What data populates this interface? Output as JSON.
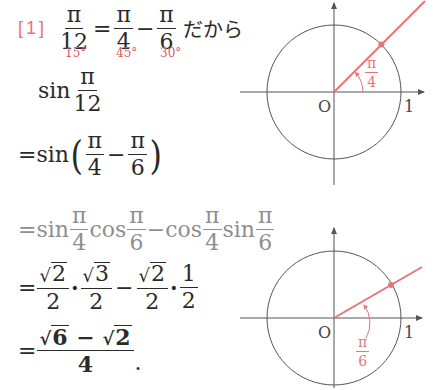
{
  "problem": {
    "label": "[1]",
    "intro": {
      "lhs": {
        "num": "π",
        "den": "12"
      },
      "eq": "=",
      "term1": {
        "num": "π",
        "den": "4"
      },
      "minus": "−",
      "term2": {
        "num": "π",
        "den": "6"
      },
      "suffix": "だから",
      "degrees": [
        "15°",
        "45°",
        "30°"
      ]
    },
    "lines": {
      "line1": {
        "func": "sin",
        "num": "π",
        "den": "12"
      },
      "line2": {
        "prefix": "=sin",
        "open": "(",
        "t1": {
          "num": "π",
          "den": "4"
        },
        "minus": "−",
        "t2": {
          "num": "π",
          "den": "6"
        },
        "close": ")"
      },
      "line3": {
        "prefix": "=sin",
        "a": {
          "num": "π",
          "den": "4"
        },
        "cos1": "cos",
        "b": {
          "num": "π",
          "den": "6"
        },
        "minus": "−cos",
        "c": {
          "num": "π",
          "den": "4"
        },
        "sin2": "sin",
        "d": {
          "num": "π",
          "den": "6"
        }
      },
      "line4": {
        "eq": "=",
        "f1": {
          "num": "2",
          "den": "2"
        },
        "f2": {
          "num": "3",
          "den": "2"
        },
        "minus": "−",
        "f3": {
          "num": "2",
          "den": "2"
        },
        "f4": {
          "num": "1",
          "den": "2"
        },
        "dot": "·",
        "sqrt": "√"
      },
      "line5": {
        "eq": "=",
        "num_a": "6",
        "minus": "−",
        "num_b": "2",
        "den": "4",
        "period": ".",
        "sqrt": "√"
      }
    }
  },
  "diagrams": [
    {
      "angle_label": {
        "num": "π",
        "den": "4"
      },
      "origin_label": "O",
      "unit_label": "1",
      "angle_deg": 45
    },
    {
      "angle_label": {
        "num": "π",
        "den": "6"
      },
      "origin_label": "O",
      "unit_label": "1",
      "angle_deg": 30
    }
  ],
  "colors": {
    "accent_red": "#e8737a",
    "text_dark": "#2a2a2a",
    "text_gray": "#8e8e8e",
    "line": "#555555"
  }
}
